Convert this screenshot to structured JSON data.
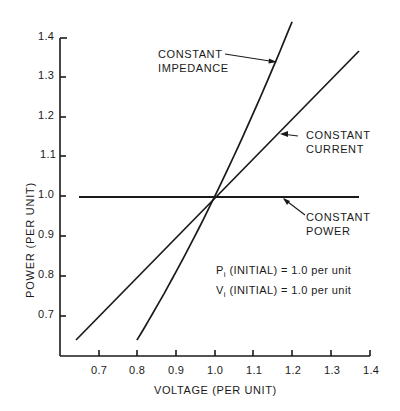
{
  "chart_data": {
    "type": "line",
    "title": "",
    "xlabel": "VOLTAGE (PER UNIT)",
    "ylabel": "POWER (PER UNIT)",
    "xlim": [
      0.6,
      1.4
    ],
    "ylim": [
      0.6,
      1.4
    ],
    "xticks": [
      "0.7",
      "0.8",
      "0.9",
      "1.0",
      "1.1",
      "1.2",
      "1.3",
      "1.4"
    ],
    "yticks": [
      "0.7",
      "0.8",
      "0.9",
      "1.0",
      "1.1",
      "1.2",
      "1.3",
      "1.4"
    ],
    "grid": false,
    "legend": "inline annotations with arrows",
    "series": [
      {
        "name": "CONSTANT IMPEDANCE",
        "label_lines": [
          "CONSTANT",
          "IMPEDANCE"
        ],
        "relation": "P = V^2",
        "x": [
          0.8,
          0.9,
          1.0,
          1.1,
          1.2
        ],
        "y": [
          0.64,
          0.81,
          1.0,
          1.21,
          1.44
        ]
      },
      {
        "name": "CONSTANT CURRENT",
        "label_lines": [
          "CONSTANT",
          "CURRENT"
        ],
        "relation": "P = V",
        "x": [
          0.64,
          0.8,
          1.0,
          1.2,
          1.37
        ],
        "y": [
          0.64,
          0.8,
          1.0,
          1.2,
          1.37
        ]
      },
      {
        "name": "CONSTANT POWER",
        "label_lines": [
          "CONSTANT",
          "POWER"
        ],
        "relation": "P = 1.0",
        "x": [
          0.65,
          1.0,
          1.37
        ],
        "y": [
          1.0,
          1.0,
          1.0
        ]
      }
    ],
    "annotations": [
      {
        "symbol": "P",
        "subscript": "i",
        "text": " (INITIAL) = 1.0 per unit"
      },
      {
        "symbol": "V",
        "subscript": "i",
        "text": " (INITIAL) = 1.0 per unit"
      }
    ]
  }
}
